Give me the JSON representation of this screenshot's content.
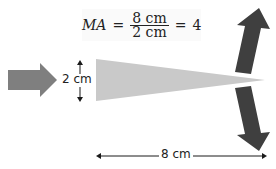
{
  "diagram": {
    "type": "wedge mechanical advantage",
    "formula": {
      "lhs": "MA",
      "equals": "=",
      "numerator": "8 cm",
      "denominator": "2 cm",
      "equals2": "=",
      "result": "4"
    },
    "labels": {
      "wedge_thickness": "2 cm",
      "wedge_length": "8 cm"
    },
    "colors": {
      "input_force_arrow": "#7f7f7f",
      "wedge": "#c9c9c9",
      "output_force_arrows": "#3f3f3f",
      "dimension_lines": "#1a1a1a"
    },
    "arrows": [
      {
        "name": "input-force",
        "direction": "right"
      },
      {
        "name": "output-force-up",
        "direction": "up-right"
      },
      {
        "name": "output-force-down",
        "direction": "down-right"
      }
    ]
  }
}
